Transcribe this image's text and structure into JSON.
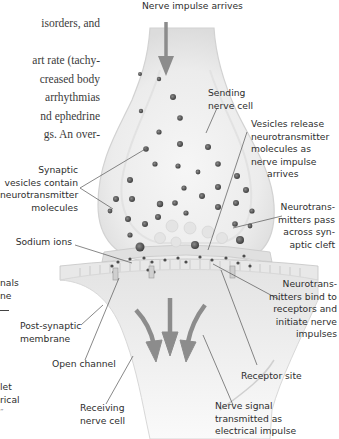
{
  "body_text": {
    "lines": [
      "isorders, and",
      "",
      "art rate (tachy-",
      "creased body",
      "arrhythmias",
      "nd ephedrine",
      "gs. An over-"
    ]
  },
  "left_margin_fragments": [
    "nals",
    "ne",
    "let",
    "rical",
    "”"
  ],
  "diagram": {
    "title_label": "Nerve impulse arrives",
    "labels": {
      "sending_nerve_cell": [
        "Sending",
        "nerve cell"
      ],
      "vesicles_release": [
        "Vesicles release",
        "neurotransmitter",
        "molecules as",
        "nerve impulse",
        "arrives"
      ],
      "synaptic_vesicles": [
        "Synaptic",
        "vesicles contain",
        "neurotransmitter",
        "molecules"
      ],
      "neurotransmitters_pass": [
        "Neurotrans-",
        "mitters pass",
        "across syn-",
        "aptic cleft"
      ],
      "sodium_ions": [
        "Sodium ions"
      ],
      "neurotransmitters_bind": [
        "Neurotrans-",
        "mitters bind to",
        "receptors and",
        "initiate nerve",
        "impulses"
      ],
      "post_synaptic_membrane": [
        "Post-synaptic",
        "membrane"
      ],
      "open_channel": [
        "Open channel"
      ],
      "receptor_site": [
        "Receptor site"
      ],
      "receiving_nerve_cell": [
        "Receiving",
        "nerve cell"
      ],
      "nerve_signal": [
        "Nerve signal",
        "transmitted as",
        "electrical impulse"
      ]
    },
    "colors": {
      "arrow": "#8c8c8c",
      "vesicle": "#5a5a5a",
      "leader_line": "#555555",
      "cell_fill": "#f2f2f2",
      "cell_edge": "#d6d6d6",
      "text": "#2e2e2e"
    }
  }
}
